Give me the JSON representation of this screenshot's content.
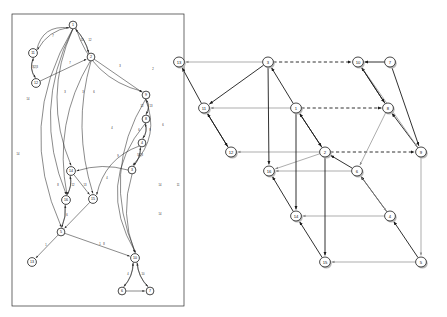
{
  "figure": {
    "title": "",
    "panels": [
      {
        "id": "left",
        "name": "left-graph",
        "caption": ""
      },
      {
        "id": "right",
        "name": "right-graph",
        "caption": ""
      }
    ]
  },
  "left_graph": {
    "name": "left-dependency-graph",
    "frame": {
      "x": 12,
      "y": 14,
      "w": 172,
      "h": 292
    },
    "nodes": [
      {
        "id": "1",
        "label": "1",
        "x": 73,
        "y": 25
      },
      {
        "id": "2",
        "label": "2",
        "x": 91,
        "y": 57
      },
      {
        "id": "11",
        "label": "11",
        "x": 33,
        "y": 53
      },
      {
        "id": "12",
        "label": "12",
        "x": 36,
        "y": 83
      },
      {
        "id": "9",
        "label": "9",
        "x": 146,
        "y": 95
      },
      {
        "id": "8",
        "label": "8",
        "x": 146,
        "y": 119
      },
      {
        "id": "4",
        "label": "4",
        "x": 142,
        "y": 143
      },
      {
        "id": "3",
        "label": "3",
        "x": 132,
        "y": 170
      },
      {
        "id": "14",
        "label": "14",
        "x": 71,
        "y": 171
      },
      {
        "id": "15",
        "label": "15",
        "x": 93,
        "y": 199
      },
      {
        "id": "16",
        "label": "16",
        "x": 66,
        "y": 200
      },
      {
        "id": "5",
        "label": "5",
        "x": 61,
        "y": 232
      },
      {
        "id": "13",
        "label": "13",
        "x": 32,
        "y": 262
      },
      {
        "id": "10",
        "label": "10",
        "x": 135,
        "y": 258
      },
      {
        "id": "6",
        "label": "6",
        "x": 122,
        "y": 291
      },
      {
        "id": "7",
        "label": "7",
        "x": 150,
        "y": 291
      }
    ],
    "edge_labels": [
      {
        "text": "7",
        "x": 53,
        "y": 37
      },
      {
        "text": "10",
        "x": 82,
        "y": 41
      },
      {
        "text": "12",
        "x": 90,
        "y": 41
      },
      {
        "text": "3|2|3",
        "x": 35,
        "y": 68
      },
      {
        "text": "7",
        "x": 70,
        "y": 64
      },
      {
        "text": "3",
        "x": 120,
        "y": 67
      },
      {
        "text": "2",
        "x": 153,
        "y": 70
      },
      {
        "text": "12",
        "x": 142,
        "y": 107
      },
      {
        "text": "13",
        "x": 151,
        "y": 107
      },
      {
        "text": "6",
        "x": 139,
        "y": 131
      },
      {
        "text": "9",
        "x": 150,
        "y": 131
      },
      {
        "text": "6",
        "x": 163,
        "y": 126
      },
      {
        "text": "4",
        "x": 112,
        "y": 129
      },
      {
        "text": "5|2|3",
        "x": 140,
        "y": 156
      },
      {
        "text": "9",
        "x": 118,
        "y": 157
      },
      {
        "text": "4",
        "x": 107,
        "y": 179
      },
      {
        "text": "8",
        "x": 58,
        "y": 186
      },
      {
        "text": "12",
        "x": 73,
        "y": 186
      },
      {
        "text": "13",
        "x": 85,
        "y": 186
      },
      {
        "text": "14",
        "x": 28,
        "y": 100
      },
      {
        "text": "3",
        "x": 65,
        "y": 93
      },
      {
        "text": "3",
        "x": 83,
        "y": 93
      },
      {
        "text": "6",
        "x": 94,
        "y": 93
      },
      {
        "text": "14",
        "x": 18,
        "y": 155
      },
      {
        "text": "14",
        "x": 160,
        "y": 186
      },
      {
        "text": "11",
        "x": 178,
        "y": 186
      },
      {
        "text": "14",
        "x": 160,
        "y": 215
      },
      {
        "text": "1",
        "x": 46,
        "y": 246
      },
      {
        "text": "1",
        "x": 100,
        "y": 245
      },
      {
        "text": "8",
        "x": 104,
        "y": 245
      },
      {
        "text": "4",
        "x": 128,
        "y": 275
      },
      {
        "text": "10",
        "x": 143,
        "y": 275
      },
      {
        "text": "6",
        "x": 67,
        "y": 216
      }
    ]
  },
  "right_graph": {
    "name": "right-lattice-graph",
    "nodes": [
      {
        "id": "13",
        "label": "13",
        "x": 179,
        "y": 62
      },
      {
        "id": "3",
        "label": "3",
        "x": 268,
        "y": 62
      },
      {
        "id": "10",
        "label": "10",
        "x": 358,
        "y": 62
      },
      {
        "id": "7",
        "label": "7",
        "x": 390,
        "y": 62
      },
      {
        "id": "11",
        "label": "11",
        "x": 204,
        "y": 108
      },
      {
        "id": "1",
        "label": "1",
        "x": 296,
        "y": 108
      },
      {
        "id": "8",
        "label": "8",
        "x": 388,
        "y": 108
      },
      {
        "id": "12",
        "label": "12",
        "x": 231,
        "y": 152
      },
      {
        "id": "2",
        "label": "2",
        "x": 325,
        "y": 152
      },
      {
        "id": "9",
        "label": "9",
        "x": 421,
        "y": 152
      },
      {
        "id": "16",
        "label": "16",
        "x": 269,
        "y": 171
      },
      {
        "id": "6",
        "label": "6",
        "x": 357,
        "y": 171
      },
      {
        "id": "14",
        "label": "14",
        "x": 296,
        "y": 216
      },
      {
        "id": "4",
        "label": "4",
        "x": 390,
        "y": 216
      },
      {
        "id": "15",
        "label": "15",
        "x": 325,
        "y": 262
      },
      {
        "id": "5",
        "label": "5",
        "x": 421,
        "y": 262
      }
    ],
    "edges": [
      {
        "from": "3",
        "to": "13",
        "style": "gray"
      },
      {
        "from": "3",
        "to": "10",
        "style": "dashed"
      },
      {
        "from": "7",
        "to": "10",
        "style": "bold"
      },
      {
        "from": "1",
        "to": "11",
        "style": "gray"
      },
      {
        "from": "1",
        "to": "8",
        "style": "dashed"
      },
      {
        "from": "2",
        "to": "12",
        "style": "gray"
      },
      {
        "from": "2",
        "to": "9",
        "style": "dashed"
      },
      {
        "from": "2",
        "to": "16",
        "style": "gray"
      },
      {
        "from": "6",
        "to": "16",
        "style": "gray"
      },
      {
        "from": "4",
        "to": "14",
        "style": "gray"
      },
      {
        "from": "5",
        "to": "15",
        "style": "gray"
      },
      {
        "from": "1",
        "to": "3",
        "style": "bold"
      },
      {
        "from": "2",
        "to": "1",
        "style": "bold"
      },
      {
        "from": "11",
        "to": "13",
        "style": "bold"
      },
      {
        "from": "12",
        "to": "11",
        "style": "bold"
      },
      {
        "from": "8",
        "to": "10",
        "style": "bold"
      },
      {
        "from": "9",
        "to": "8",
        "style": "bold"
      },
      {
        "from": "6",
        "to": "2",
        "style": "bold"
      },
      {
        "from": "4",
        "to": "6",
        "style": "bold"
      },
      {
        "from": "5",
        "to": "4",
        "style": "bold"
      },
      {
        "from": "14",
        "to": "16",
        "style": "bold"
      },
      {
        "from": "15",
        "to": "14",
        "style": "bold"
      },
      {
        "from": "3",
        "to": "16",
        "style": "bold"
      },
      {
        "from": "1",
        "to": "2",
        "style": "bold"
      },
      {
        "from": "1",
        "to": "14",
        "style": "bold"
      },
      {
        "from": "2",
        "to": "15",
        "style": "bold"
      },
      {
        "from": "10",
        "to": "9",
        "style": "gray"
      },
      {
        "from": "8",
        "to": "6",
        "style": "gray"
      },
      {
        "from": "6",
        "to": "4",
        "style": "gray"
      },
      {
        "from": "9",
        "to": "5",
        "style": "gray"
      },
      {
        "from": "7",
        "to": "9",
        "style": "bold"
      },
      {
        "from": "11",
        "to": "12",
        "style": "bold"
      },
      {
        "from": "3",
        "to": "11",
        "style": "bold"
      },
      {
        "from": "10",
        "to": "8",
        "style": "bold"
      }
    ]
  },
  "colors": {
    "node_fill": "#ffffff",
    "node_stroke": "#1a1a1a",
    "edge_dark": "#1a1a1a",
    "edge_gray": "#8a8a8a",
    "shadow": "#b9b9b9",
    "background": "#ffffff"
  }
}
